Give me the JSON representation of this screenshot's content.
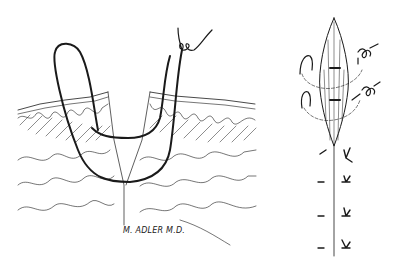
{
  "figure": {
    "type": "medical-illustration",
    "signature": "M. ADLER M.D.",
    "panels": [
      {
        "name": "cross-section",
        "description": "Skin cross-section with looped suture through epidermis and dermis, knot tied at top right"
      },
      {
        "name": "surface-view",
        "description": "Top view of elliptical wound closed with interrupted sutures and knots along incision line"
      }
    ]
  },
  "colors": {
    "ink": "#1a1a1a",
    "background": "#ffffff"
  }
}
